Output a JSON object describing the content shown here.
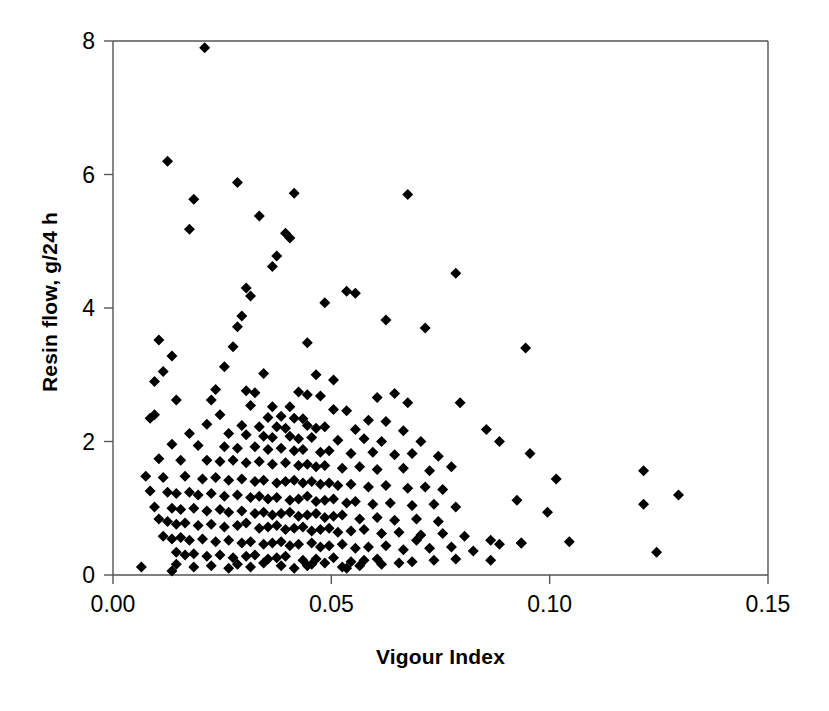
{
  "chart_data": {
    "type": "scatter",
    "title": "",
    "xlabel": "Vigour Index",
    "ylabel": "Resin flow, g/24 h",
    "xlim": [
      0.0,
      0.15
    ],
    "ylim": [
      0,
      8
    ],
    "xticks": [
      "0.00",
      "0.05",
      "0.10",
      "0.15"
    ],
    "xtick_values": [
      0.0,
      0.05,
      0.1,
      0.15
    ],
    "yticks": [
      "0",
      "2",
      "4",
      "6",
      "8"
    ],
    "ytick_values": [
      0,
      2,
      4,
      6,
      8
    ],
    "grid": false,
    "legend": null,
    "marker": "diamond",
    "marker_color": "#000000",
    "marker_size": 9,
    "n_points": 288,
    "series": [
      {
        "name": "Resin flow vs Vigour Index",
        "points": [
          [
            0.021,
            7.9
          ],
          [
            0.0125,
            6.2
          ],
          [
            0.0285,
            5.88
          ],
          [
            0.0185,
            5.63
          ],
          [
            0.0415,
            5.72
          ],
          [
            0.0675,
            5.7
          ],
          [
            0.0175,
            5.18
          ],
          [
            0.0335,
            5.38
          ],
          [
            0.0395,
            5.12
          ],
          [
            0.0405,
            5.05
          ],
          [
            0.0375,
            4.78
          ],
          [
            0.0365,
            4.62
          ],
          [
            0.0785,
            4.52
          ],
          [
            0.0305,
            4.3
          ],
          [
            0.0315,
            4.18
          ],
          [
            0.0535,
            4.25
          ],
          [
            0.0555,
            4.22
          ],
          [
            0.0485,
            4.08
          ],
          [
            0.0295,
            3.88
          ],
          [
            0.0625,
            3.82
          ],
          [
            0.0285,
            3.72
          ],
          [
            0.0715,
            3.7
          ],
          [
            0.0105,
            3.52
          ],
          [
            0.0445,
            3.48
          ],
          [
            0.0275,
            3.42
          ],
          [
            0.0945,
            3.4
          ],
          [
            0.0135,
            3.28
          ],
          [
            0.0115,
            3.05
          ],
          [
            0.0255,
            3.12
          ],
          [
            0.0345,
            3.02
          ],
          [
            0.0465,
            3.0
          ],
          [
            0.0505,
            2.92
          ],
          [
            0.0095,
            2.9
          ],
          [
            0.0235,
            2.78
          ],
          [
            0.0305,
            2.76
          ],
          [
            0.0325,
            2.73
          ],
          [
            0.0425,
            2.74
          ],
          [
            0.0445,
            2.7
          ],
          [
            0.0645,
            2.72
          ],
          [
            0.0605,
            2.66
          ],
          [
            0.0475,
            2.68
          ],
          [
            0.0145,
            2.62
          ],
          [
            0.0225,
            2.62
          ],
          [
            0.0675,
            2.58
          ],
          [
            0.0795,
            2.58
          ],
          [
            0.0315,
            2.54
          ],
          [
            0.0365,
            2.52
          ],
          [
            0.0405,
            2.52
          ],
          [
            0.0505,
            2.48
          ],
          [
            0.0535,
            2.46
          ],
          [
            0.0095,
            2.4
          ],
          [
            0.0085,
            2.35
          ],
          [
            0.0245,
            2.4
          ],
          [
            0.0355,
            2.36
          ],
          [
            0.0385,
            2.38
          ],
          [
            0.0415,
            2.35
          ],
          [
            0.0435,
            2.34
          ],
          [
            0.0585,
            2.32
          ],
          [
            0.0625,
            2.3
          ],
          [
            0.0215,
            2.26
          ],
          [
            0.0295,
            2.24
          ],
          [
            0.0335,
            2.22
          ],
          [
            0.0375,
            2.22
          ],
          [
            0.0395,
            2.2
          ],
          [
            0.0445,
            2.24
          ],
          [
            0.0465,
            2.2
          ],
          [
            0.0485,
            2.22
          ],
          [
            0.0555,
            2.18
          ],
          [
            0.0665,
            2.16
          ],
          [
            0.0855,
            2.18
          ],
          [
            0.0175,
            2.12
          ],
          [
            0.0265,
            2.12
          ],
          [
            0.0305,
            2.1
          ],
          [
            0.0345,
            2.08
          ],
          [
            0.0365,
            2.06
          ],
          [
            0.0405,
            2.08
          ],
          [
            0.0425,
            2.04
          ],
          [
            0.0455,
            2.06
          ],
          [
            0.0515,
            2.02
          ],
          [
            0.0575,
            2.04
          ],
          [
            0.0615,
            2.0
          ],
          [
            0.0705,
            2.0
          ],
          [
            0.0885,
            2.0
          ],
          [
            0.0135,
            1.96
          ],
          [
            0.0195,
            1.94
          ],
          [
            0.0255,
            1.92
          ],
          [
            0.0285,
            1.9
          ],
          [
            0.0325,
            1.92
          ],
          [
            0.0355,
            1.88
          ],
          [
            0.0385,
            1.9
          ],
          [
            0.0415,
            1.86
          ],
          [
            0.0435,
            1.88
          ],
          [
            0.0475,
            1.84
          ],
          [
            0.0495,
            1.86
          ],
          [
            0.0545,
            1.82
          ],
          [
            0.0595,
            1.84
          ],
          [
            0.0645,
            1.8
          ],
          [
            0.0685,
            1.82
          ],
          [
            0.0745,
            1.78
          ],
          [
            0.0955,
            1.82
          ],
          [
            0.0105,
            1.74
          ],
          [
            0.0155,
            1.72
          ],
          [
            0.0215,
            1.72
          ],
          [
            0.0245,
            1.7
          ],
          [
            0.0275,
            1.72
          ],
          [
            0.0305,
            1.68
          ],
          [
            0.0335,
            1.7
          ],
          [
            0.0365,
            1.66
          ],
          [
            0.0395,
            1.68
          ],
          [
            0.0425,
            1.64
          ],
          [
            0.0445,
            1.66
          ],
          [
            0.0465,
            1.62
          ],
          [
            0.0485,
            1.64
          ],
          [
            0.0525,
            1.6
          ],
          [
            0.0565,
            1.62
          ],
          [
            0.0605,
            1.58
          ],
          [
            0.0665,
            1.6
          ],
          [
            0.0725,
            1.56
          ],
          [
            0.0775,
            1.62
          ],
          [
            0.1215,
            1.56
          ],
          [
            0.0075,
            1.48
          ],
          [
            0.0115,
            1.46
          ],
          [
            0.0165,
            1.48
          ],
          [
            0.0205,
            1.44
          ],
          [
            0.0235,
            1.46
          ],
          [
            0.0265,
            1.42
          ],
          [
            0.0295,
            1.44
          ],
          [
            0.0325,
            1.4
          ],
          [
            0.0345,
            1.42
          ],
          [
            0.0375,
            1.38
          ],
          [
            0.0395,
            1.4
          ],
          [
            0.0415,
            1.42
          ],
          [
            0.0435,
            1.38
          ],
          [
            0.0455,
            1.4
          ],
          [
            0.0475,
            1.36
          ],
          [
            0.0495,
            1.38
          ],
          [
            0.0515,
            1.34
          ],
          [
            0.0545,
            1.36
          ],
          [
            0.0585,
            1.32
          ],
          [
            0.0625,
            1.34
          ],
          [
            0.0675,
            1.3
          ],
          [
            0.0715,
            1.32
          ],
          [
            0.0755,
            1.28
          ],
          [
            0.1015,
            1.44
          ],
          [
            0.1295,
            1.2
          ],
          [
            0.0085,
            1.26
          ],
          [
            0.0125,
            1.24
          ],
          [
            0.0145,
            1.22
          ],
          [
            0.0175,
            1.24
          ],
          [
            0.0195,
            1.2
          ],
          [
            0.0225,
            1.22
          ],
          [
            0.0255,
            1.18
          ],
          [
            0.0285,
            1.2
          ],
          [
            0.0315,
            1.16
          ],
          [
            0.0335,
            1.18
          ],
          [
            0.0355,
            1.14
          ],
          [
            0.0375,
            1.16
          ],
          [
            0.0405,
            1.12
          ],
          [
            0.0425,
            1.14
          ],
          [
            0.0445,
            1.18
          ],
          [
            0.0465,
            1.1
          ],
          [
            0.0485,
            1.12
          ],
          [
            0.0505,
            1.14
          ],
          [
            0.0535,
            1.08
          ],
          [
            0.0555,
            1.1
          ],
          [
            0.0595,
            1.06
          ],
          [
            0.0635,
            1.08
          ],
          [
            0.0685,
            1.04
          ],
          [
            0.0735,
            1.06
          ],
          [
            0.0785,
            1.02
          ],
          [
            0.0925,
            1.12
          ],
          [
            0.1215,
            1.06
          ],
          [
            0.0995,
            0.94
          ],
          [
            0.0095,
            1.02
          ],
          [
            0.0135,
            1.0
          ],
          [
            0.0155,
            0.98
          ],
          [
            0.0185,
            1.0
          ],
          [
            0.0215,
            0.96
          ],
          [
            0.0245,
            0.98
          ],
          [
            0.0265,
            0.94
          ],
          [
            0.0295,
            0.96
          ],
          [
            0.0325,
            0.92
          ],
          [
            0.0345,
            0.94
          ],
          [
            0.0365,
            0.9
          ],
          [
            0.0385,
            0.92
          ],
          [
            0.0405,
            0.94
          ],
          [
            0.0425,
            0.88
          ],
          [
            0.0445,
            0.9
          ],
          [
            0.0465,
            0.92
          ],
          [
            0.0485,
            0.86
          ],
          [
            0.0505,
            0.88
          ],
          [
            0.0525,
            0.9
          ],
          [
            0.0565,
            0.84
          ],
          [
            0.0605,
            0.86
          ],
          [
            0.0645,
            0.82
          ],
          [
            0.0695,
            0.84
          ],
          [
            0.0745,
            0.8
          ],
          [
            0.0105,
            0.84
          ],
          [
            0.0125,
            0.8
          ],
          [
            0.0145,
            0.76
          ],
          [
            0.0165,
            0.78
          ],
          [
            0.0195,
            0.74
          ],
          [
            0.0225,
            0.76
          ],
          [
            0.0255,
            0.72
          ],
          [
            0.0285,
            0.74
          ],
          [
            0.0305,
            0.78
          ],
          [
            0.0335,
            0.7
          ],
          [
            0.0355,
            0.72
          ],
          [
            0.0375,
            0.74
          ],
          [
            0.0395,
            0.68
          ],
          [
            0.0415,
            0.7
          ],
          [
            0.0435,
            0.72
          ],
          [
            0.0455,
            0.66
          ],
          [
            0.0475,
            0.68
          ],
          [
            0.0495,
            0.7
          ],
          [
            0.0515,
            0.64
          ],
          [
            0.0545,
            0.66
          ],
          [
            0.0575,
            0.68
          ],
          [
            0.0615,
            0.62
          ],
          [
            0.0655,
            0.64
          ],
          [
            0.0705,
            0.6
          ],
          [
            0.0755,
            0.62
          ],
          [
            0.0805,
            0.58
          ],
          [
            0.0865,
            0.52
          ],
          [
            0.0885,
            0.46
          ],
          [
            0.0935,
            0.48
          ],
          [
            0.1245,
            0.34
          ],
          [
            0.0115,
            0.58
          ],
          [
            0.0135,
            0.54
          ],
          [
            0.0155,
            0.56
          ],
          [
            0.0175,
            0.52
          ],
          [
            0.0205,
            0.54
          ],
          [
            0.0235,
            0.5
          ],
          [
            0.0265,
            0.52
          ],
          [
            0.0295,
            0.48
          ],
          [
            0.0315,
            0.5
          ],
          [
            0.0345,
            0.46
          ],
          [
            0.0365,
            0.48
          ],
          [
            0.0385,
            0.5
          ],
          [
            0.0405,
            0.44
          ],
          [
            0.0425,
            0.46
          ],
          [
            0.0455,
            0.48
          ],
          [
            0.0475,
            0.42
          ],
          [
            0.0495,
            0.44
          ],
          [
            0.0525,
            0.46
          ],
          [
            0.0555,
            0.4
          ],
          [
            0.0585,
            0.42
          ],
          [
            0.0625,
            0.44
          ],
          [
            0.0665,
            0.38
          ],
          [
            0.0695,
            0.52
          ],
          [
            0.0725,
            0.4
          ],
          [
            0.0775,
            0.42
          ],
          [
            0.0825,
            0.36
          ],
          [
            0.0145,
            0.34
          ],
          [
            0.0165,
            0.3
          ],
          [
            0.0185,
            0.32
          ],
          [
            0.0215,
            0.28
          ],
          [
            0.0245,
            0.3
          ],
          [
            0.0275,
            0.26
          ],
          [
            0.0305,
            0.28
          ],
          [
            0.0325,
            0.3
          ],
          [
            0.0355,
            0.24
          ],
          [
            0.0375,
            0.26
          ],
          [
            0.0395,
            0.28
          ],
          [
            0.0435,
            0.22
          ],
          [
            0.0465,
            0.24
          ],
          [
            0.0505,
            0.26
          ],
          [
            0.0545,
            0.2
          ],
          [
            0.0575,
            0.22
          ],
          [
            0.0605,
            0.24
          ],
          [
            0.0655,
            0.18
          ],
          [
            0.0685,
            0.2
          ],
          [
            0.0735,
            0.22
          ],
          [
            0.0785,
            0.24
          ],
          [
            0.0865,
            0.22
          ],
          [
            0.0935,
            0.48
          ],
          [
            0.1045,
            0.5
          ],
          [
            0.0065,
            0.12
          ],
          [
            0.0135,
            0.06
          ],
          [
            0.0145,
            0.16
          ],
          [
            0.0185,
            0.12
          ],
          [
            0.0225,
            0.14
          ],
          [
            0.0265,
            0.1
          ],
          [
            0.0285,
            0.16
          ],
          [
            0.0315,
            0.12
          ],
          [
            0.0345,
            0.18
          ],
          [
            0.0385,
            0.14
          ],
          [
            0.0415,
            0.1
          ],
          [
            0.0455,
            0.16
          ],
          [
            0.0485,
            0.18
          ],
          [
            0.0525,
            0.12
          ],
          [
            0.0565,
            0.14
          ],
          [
            0.0615,
            0.16
          ],
          [
            0.0445,
            0.14
          ],
          [
            0.0535,
            0.1
          ]
        ]
      }
    ]
  },
  "plot_geometry": {
    "left": 113,
    "top": 41,
    "right": 768,
    "bottom": 575
  },
  "axes": {
    "y_title": "Resin flow, g/24 h",
    "x_title": "Vigour Index"
  }
}
